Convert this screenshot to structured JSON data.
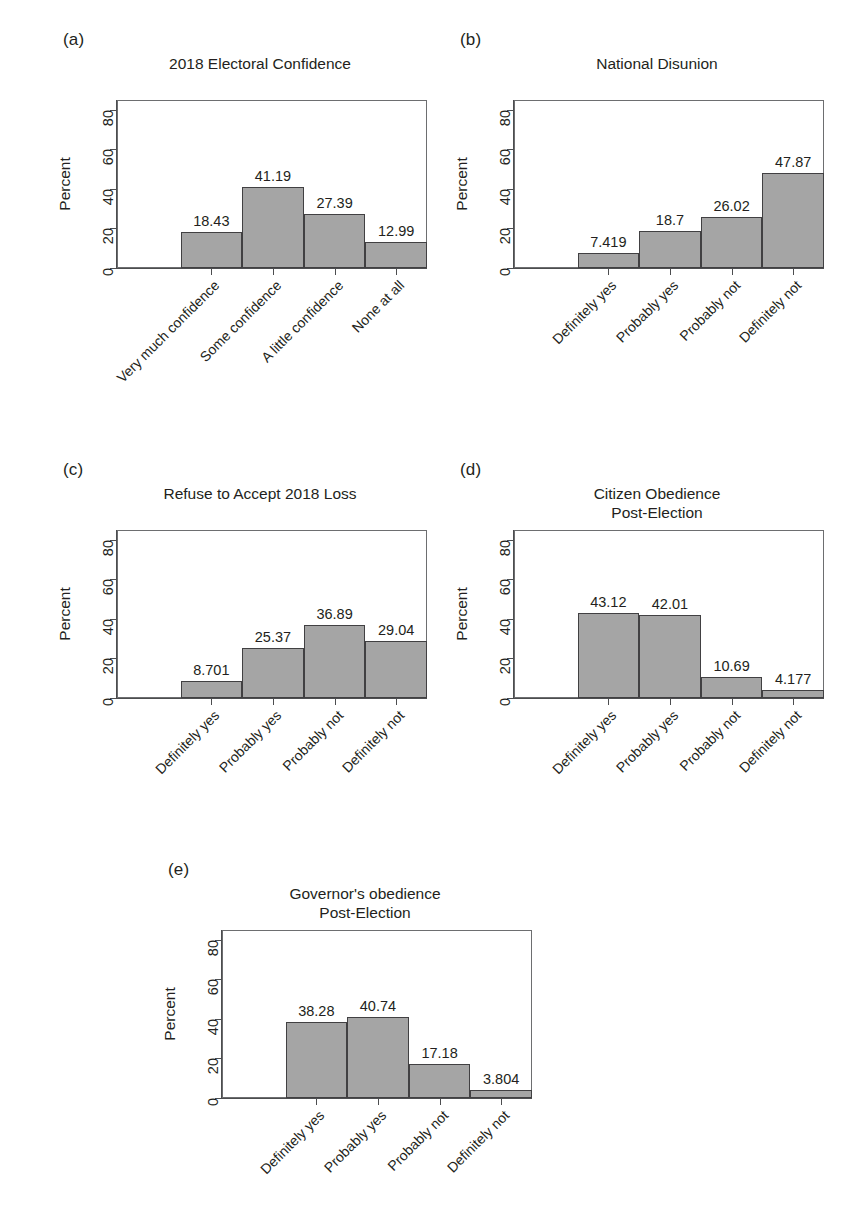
{
  "figure": {
    "axis_title": "Percent",
    "y_ticks": [
      "0",
      "20",
      "40",
      "60",
      "80"
    ],
    "bar_fill_color": "#a5a5a5",
    "bar_border_color": "#414042",
    "text_color": "#231f20"
  },
  "chart_data": [
    {
      "type": "bar",
      "panel": "(a)",
      "title": "2018 Electoral Confidence",
      "categories": [
        "Very much confidence",
        "Some confidence",
        "A little confidence",
        "None at all"
      ],
      "values": [
        18.43,
        41.19,
        27.39,
        12.99
      ],
      "labels": [
        "18.43",
        "41.19",
        "27.39",
        "12.99"
      ],
      "xlabel": "",
      "ylabel": "Percent",
      "ylim": [
        0,
        85
      ],
      "yticks": [
        0,
        20,
        40,
        60,
        80
      ],
      "grid": false,
      "legend": "none"
    },
    {
      "type": "bar",
      "panel": "(b)",
      "title": "National Disunion",
      "categories": [
        "Definitely yes",
        "Probably yes",
        "Probably not",
        "Definitely not"
      ],
      "values": [
        7.419,
        18.7,
        26.02,
        47.87
      ],
      "labels": [
        "7.419",
        "18.7",
        "26.02",
        "47.87"
      ],
      "xlabel": "",
      "ylabel": "Percent",
      "ylim": [
        0,
        85
      ],
      "yticks": [
        0,
        20,
        40,
        60,
        80
      ],
      "grid": false,
      "legend": "none"
    },
    {
      "type": "bar",
      "panel": "(c)",
      "title": "Refuse to Accept 2018 Loss",
      "categories": [
        "Definitely yes",
        "Probably yes",
        "Probably not",
        "Definitely not"
      ],
      "values": [
        8.701,
        25.37,
        36.89,
        29.04
      ],
      "labels": [
        "8.701",
        "25.37",
        "36.89",
        "29.04"
      ],
      "xlabel": "",
      "ylabel": "Percent",
      "ylim": [
        0,
        85
      ],
      "yticks": [
        0,
        20,
        40,
        60,
        80
      ],
      "grid": false,
      "legend": "none"
    },
    {
      "type": "bar",
      "panel": "(d)",
      "title": "Citizen Obedience\nPost-Election",
      "categories": [
        "Definitely yes",
        "Probably yes",
        "Probably not",
        "Definitely not"
      ],
      "values": [
        43.12,
        42.01,
        10.69,
        4.177
      ],
      "labels": [
        "43.12",
        "42.01",
        "10.69",
        "4.177"
      ],
      "xlabel": "",
      "ylabel": "Percent",
      "ylim": [
        0,
        85
      ],
      "yticks": [
        0,
        20,
        40,
        60,
        80
      ],
      "grid": false,
      "legend": "none"
    },
    {
      "type": "bar",
      "panel": "(e)",
      "title": "Governor's obedience\nPost-Election",
      "categories": [
        "Definitely yes",
        "Probably yes",
        "Probably not",
        "Definitely not"
      ],
      "values": [
        38.28,
        40.74,
        17.18,
        3.804
      ],
      "labels": [
        "38.28",
        "40.74",
        "17.18",
        "3.804"
      ],
      "xlabel": "",
      "ylabel": "Percent",
      "ylim": [
        0,
        85
      ],
      "yticks": [
        0,
        20,
        40,
        60,
        80
      ],
      "grid": false,
      "legend": "none"
    }
  ]
}
